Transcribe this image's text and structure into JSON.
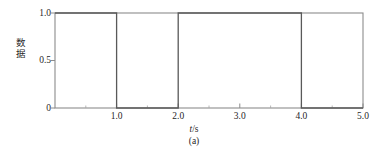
{
  "chart_data": {
    "type": "line",
    "subtype": "square-wave-step",
    "title": "",
    "caption": "(a)",
    "xlabel": "t/s",
    "xlabel_italic_part": "t",
    "ylabel": "数据",
    "xlim": [
      0.0,
      5.0
    ],
    "ylim": [
      0.0,
      1.0
    ],
    "grid": false,
    "legend": null,
    "x_ticks": [
      1.0,
      2.0,
      3.0,
      4.0,
      5.0
    ],
    "x_tick_labels": [
      "1.0",
      "2.0",
      "3.0",
      "4.0",
      "5.0"
    ],
    "x_minor_ticks": [
      0.5,
      1.5,
      2.5,
      3.5,
      4.5
    ],
    "y_ticks": [
      0.0,
      0.5,
      1.0
    ],
    "y_tick_labels": [
      "0",
      "0.5",
      "1.0"
    ],
    "series": [
      {
        "name": "数据",
        "color": "#595959",
        "linewidth": 1.1,
        "points": [
          {
            "x": 0.0,
            "y": 1.0
          },
          {
            "x": 1.0,
            "y": 1.0
          },
          {
            "x": 1.0,
            "y": 0.0
          },
          {
            "x": 2.0,
            "y": 0.0
          },
          {
            "x": 2.0,
            "y": 1.0
          },
          {
            "x": 4.0,
            "y": 1.0
          },
          {
            "x": 4.0,
            "y": 0.0
          },
          {
            "x": 5.0,
            "y": 0.0
          }
        ],
        "segments": [
          {
            "from": 0.0,
            "to": 1.0,
            "level": 1.0
          },
          {
            "from": 1.0,
            "to": 2.0,
            "level": 0.0
          },
          {
            "from": 2.0,
            "to": 4.0,
            "level": 1.0
          },
          {
            "from": 4.0,
            "to": 5.0,
            "level": 0.0
          }
        ]
      }
    ],
    "frame": {
      "box": true,
      "color": "#8c8c8c"
    }
  },
  "colors": {
    "background": "#ffffff",
    "frame": "#8c8c8c",
    "data_line": "#595959",
    "text": "#1f1f1f",
    "tick": "#8c8c8c"
  }
}
